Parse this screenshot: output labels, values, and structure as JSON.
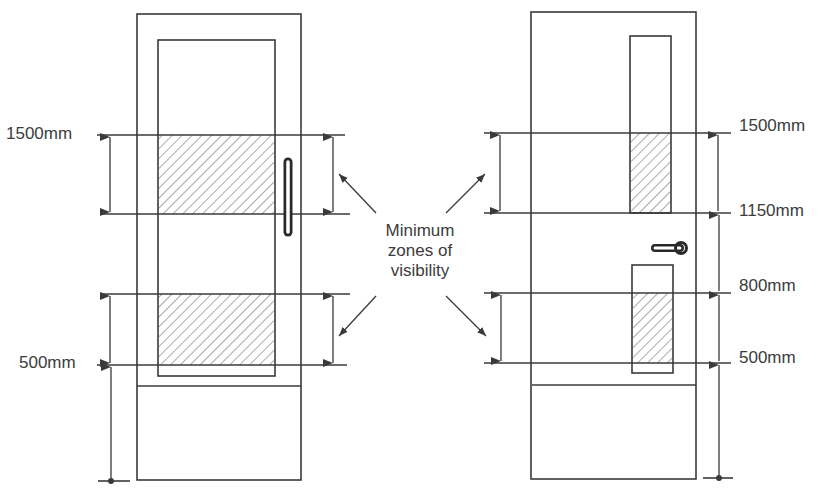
{
  "diagram": {
    "center_label": {
      "line1": "Minimum",
      "line2": "zones of",
      "line3": "visibility"
    },
    "left_door": {
      "labels": {
        "top": "1500mm",
        "bottom": "500mm"
      }
    },
    "right_door": {
      "labels": {
        "l1500": "1500mm",
        "l1150": "1150mm",
        "l800": "800mm",
        "l500": "500mm"
      }
    },
    "colors": {
      "line": "#3a3a3a",
      "text": "#3c3c3c",
      "hatch": "#555555",
      "background": "#ffffff"
    }
  }
}
